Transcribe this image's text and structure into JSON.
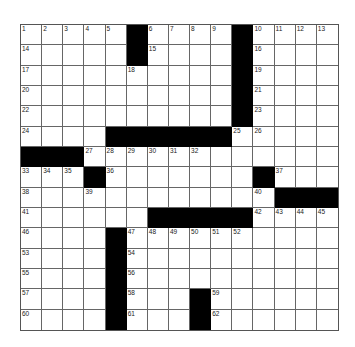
{
  "puzzle": {
    "type": "crossword",
    "rows": 15,
    "cols": 15,
    "layout": [
      "1,2,3,4,5,#,6,7,8,9,#,10,11,12,13",
      "14,.,.,.,.,#,15,.,.,.,#,16,.,.,.",
      "17,.,.,.,.,18,.,.,.,.,#,19,.,.,.",
      "20,.,.,.,.,.,.,.,.,.,#,21,.,.,.",
      "22,.,.,.,.,.,.,.,.,.,#,23,.,.,.",
      "24,.,.,.,#,#,#,#,#,#,25,26,.,.,.",
      "#,#,#,27,28,29,30,31,32,.,.,.,.,.,.",
      "33,34,35,#,36,.,.,.,.,.,.,#,37,.,.",
      "38,.,.,39,.,.,.,.,.,.,.,40,#,#,#",
      "41,.,.,.,.,.,#,#,#,#,#,42,43,44,45",
      "46,.,.,.,#,47,48,49,50,51,52,.,.,.,.",
      "53,.,.,.,#,54,.,.,.,.,.,.,.,.,.",
      "55,.,.,.,#,56,.,.,.,.,.,.,.,.,.",
      "57,.,.,.,#,58,.,.,#,59,.,.,.,.,.",
      "60,.,.,.,#,61,.,.,#,62,.,.,.,.,."
    ],
    "colors": {
      "block": "#000000",
      "cell": "#ffffff",
      "line": "#666666"
    }
  }
}
